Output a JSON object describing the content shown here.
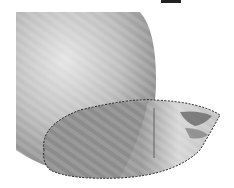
{
  "canvas": {
    "description": "Grayscale rendered sphere with elliptical selection",
    "background_color": "#ffffff",
    "sphere_light": "#d8d8d8",
    "sphere_dark": "#7a7a7a",
    "selection_style": "marching-ants",
    "selection_stroke": "#222222"
  }
}
